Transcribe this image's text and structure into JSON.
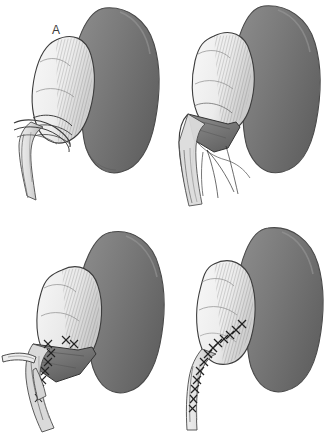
{
  "figure": {
    "background_color": "#ffffff",
    "panel_count": 4,
    "layout": "2x2 grid",
    "width_px": 329,
    "height_px": 433
  },
  "palette": {
    "background": "#ffffff",
    "kidney_fill_light": "#8a8a8a",
    "kidney_fill_mid": "#787878",
    "kidney_fill_dark": "#636363",
    "kidney_outline": "#4a4a4a",
    "pelvis_fill_light": "#f4f4f4",
    "pelvis_fill_mid": "#e2e2e2",
    "pelvis_fill_shadow": "#c2c2c2",
    "pelvis_outline": "#3d3d3d",
    "hatch_line": "#5a5a5a",
    "suture_thread": "#2e2e2e",
    "label_text": "#3a3a3a",
    "lumen_shadow": "#6e6e6e"
  },
  "panels": [
    {
      "id": "a",
      "label": "A",
      "label_x": 52,
      "label_y": 24,
      "caption_stage": "Exposure of the dilated renal pelvis and ureteropelvic junction",
      "structures": [
        "kidney",
        "dilated-renal-pelvis",
        "ureter",
        "crossing-vessel"
      ],
      "suture_line": false,
      "flap_open": false
    },
    {
      "id": "b",
      "label": "B",
      "label_x": 206,
      "label_y": 21,
      "caption_stage": "Pelvis incised and spatulated; traction sutures placed",
      "structures": [
        "kidney",
        "renal-pelvis-flap",
        "spatulated-ureter",
        "traction-suture-threads"
      ],
      "suture_line": false,
      "flap_open": true
    },
    {
      "id": "c",
      "label": "C",
      "label_x": 59,
      "label_y": 241,
      "caption_stage": "Posterior anastomosis of pelvic flap to spatulated ureter",
      "structures": [
        "kidney",
        "renal-pelvis-flap",
        "anastomosis-sutures",
        "ureter"
      ],
      "suture_line": true,
      "flap_open": true
    },
    {
      "id": "d",
      "label": "D",
      "label_x": 216,
      "label_y": 236,
      "caption_stage": "Completed pyeloplasty with continuous suture line",
      "structures": [
        "kidney",
        "reconstructed-pelvis",
        "continuous-suture-line",
        "ureter"
      ],
      "suture_line": true,
      "flap_open": false
    }
  ]
}
